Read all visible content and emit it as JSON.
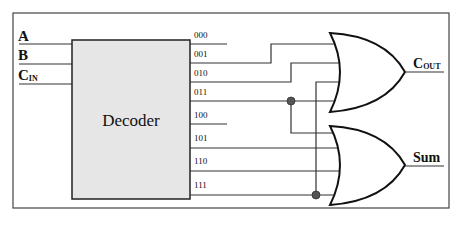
{
  "diagram": {
    "inputs": [
      {
        "label": "A",
        "sub": ""
      },
      {
        "label": "B",
        "sub": ""
      },
      {
        "label": "C",
        "sub": "IN"
      }
    ],
    "decoder": {
      "label": "Decoder"
    },
    "decoder_outputs": [
      "000",
      "001",
      "010",
      "011",
      "100",
      "101",
      "110",
      "111"
    ],
    "gates": [
      {
        "type": "OR",
        "output_label": "C",
        "output_sub": "OUT",
        "inputs_from": [
          "011",
          "101",
          "110",
          "111"
        ]
      },
      {
        "type": "OR",
        "output_label": "Sum",
        "output_sub": "",
        "inputs_from": [
          "001",
          "010",
          "100",
          "111"
        ]
      }
    ],
    "colors": {
      "decoder_fill": "#e6e6e6",
      "wire": "#333333",
      "junction": "#555555"
    }
  }
}
